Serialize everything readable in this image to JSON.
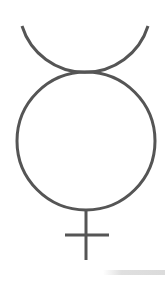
{
  "symbol": {
    "name": "Mercury",
    "glyph": "☿",
    "stroke_color": "#555555",
    "background_color": "#ffffff"
  }
}
